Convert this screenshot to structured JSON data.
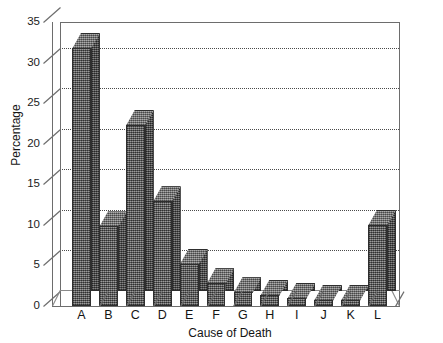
{
  "chart_data": {
    "type": "bar",
    "title": "",
    "xlabel": "Cause of Death",
    "ylabel": "Percentage",
    "categories": [
      "A",
      "B",
      "C",
      "D",
      "E",
      "F",
      "G",
      "H",
      "I",
      "J",
      "K",
      "L"
    ],
    "values": [
      31.8,
      9.8,
      22.3,
      12.9,
      5.2,
      2.8,
      1.7,
      1.4,
      1.0,
      0.8,
      0.8,
      10.0
    ],
    "ylim": [
      0,
      35
    ],
    "ytick_labels": [
      "0",
      "5",
      "10",
      "15",
      "20",
      "25",
      "30",
      "35"
    ],
    "ytick_values": [
      0,
      5,
      10,
      15,
      20,
      25,
      30,
      35
    ],
    "grid": "horizontal-dotted",
    "legend": "none",
    "style": "3d-shaded-bars",
    "bar_color": "#6a6a6a",
    "bar_edge_color": "#2e2e2e",
    "axis_color": "#6d6d6d",
    "grid_color": "#4a4a4a",
    "background": "#ffffff"
  },
  "axes": {
    "y_title": "Percentage",
    "x_title": "Cause of Death"
  }
}
